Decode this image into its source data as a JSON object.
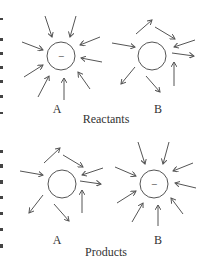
{
  "diagram": {
    "stroke_color": "#555555",
    "text_color": "#333333",
    "panels": [
      {
        "caption": "Reactants",
        "molecules": [
          {
            "label": "A",
            "charge": "−",
            "arrows_direction": "inward",
            "arrow_count": 9
          },
          {
            "label": "B",
            "charge": "",
            "arrows_direction": "mixed",
            "arrow_count": 7
          }
        ]
      },
      {
        "caption": "Products",
        "molecules": [
          {
            "label": "A",
            "charge": "",
            "arrows_direction": "mixed",
            "arrow_count": 7
          },
          {
            "label": "B",
            "charge": "−",
            "arrows_direction": "inward",
            "arrow_count": 9
          }
        ]
      }
    ]
  }
}
